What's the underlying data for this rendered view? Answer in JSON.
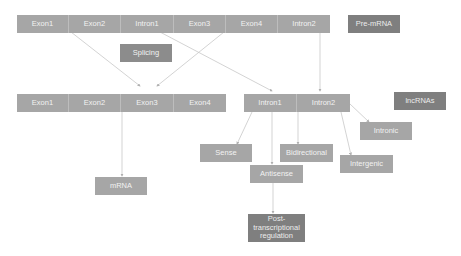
{
  "pre_mrna_row": {
    "segments": [
      "Exon1",
      "Exon2",
      "Intron1",
      "Exon3",
      "Exon4",
      "Intron2"
    ],
    "label": "Pre-mRNA"
  },
  "splicing": {
    "label": "Splicing"
  },
  "spliced_exons": {
    "segments": [
      "Exon1",
      "Exon2",
      "Exon3",
      "Exon4"
    ]
  },
  "introns": {
    "segments": [
      "Intron1",
      "Intron2"
    ]
  },
  "lncrnas": {
    "label": "lncRNAs"
  },
  "mrna": {
    "label": "mRNA"
  },
  "lncrna_types": {
    "sense": "Sense",
    "antisense": "Antisense",
    "bidirectional": "Bidirectional",
    "intronic": "Intronic",
    "intergenic": "Intergenic"
  },
  "post_transcriptional": {
    "label": "Post-transcriptional regulation"
  },
  "colors": {
    "box": "#a6a6a6",
    "dark_box": "#7f7f7f",
    "arrow": "#c8c8c8"
  }
}
